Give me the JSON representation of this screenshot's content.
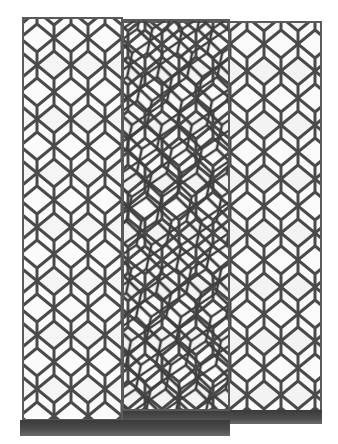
{
  "image": {
    "description": "Product photo of a three-panel folding room divider screen with a hexagonal / honeycomb wire lattice pattern and dark wooden bases, on a white background",
    "subject": "room divider screen",
    "panel_count": 3,
    "pattern": "hexagonal lattice",
    "colors": {
      "background": "#ffffff",
      "lattice": "#4a4a4a",
      "panel_fill": "#f4f4f4",
      "base": "#3e3e3e"
    }
  }
}
